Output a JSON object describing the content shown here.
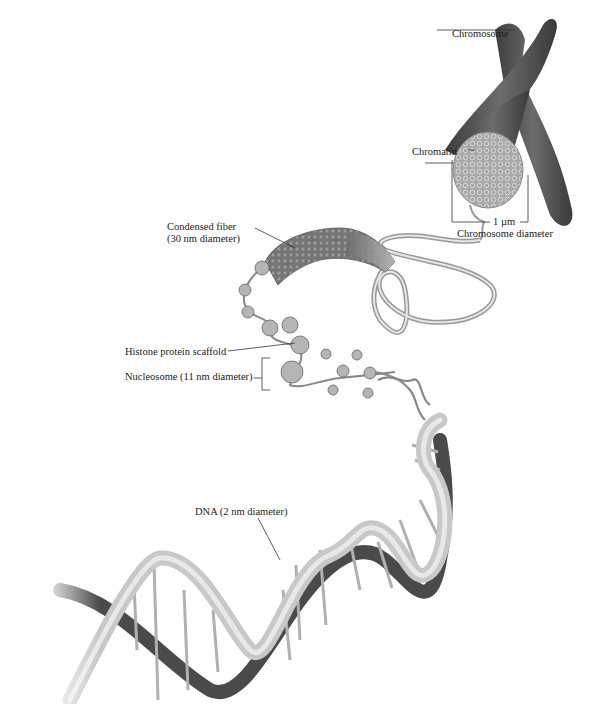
{
  "figure": {
    "labels": {
      "chromosome": "Chromosome",
      "chromatin": "Chromatin",
      "scale": "1 µm",
      "chromosome_diameter": "Chromosome diameter",
      "condensed_fiber_line1": "Condensed fiber",
      "condensed_fiber_line2": "(30 nm diameter)",
      "histone": "Histone protein scaffold",
      "nucleosome": "Nucleosome (11 nm diameter)",
      "dna": "DNA (2 nm diameter)"
    },
    "colors": {
      "chromosome": "#5a5a5a",
      "chromatin": "#9a9a9a",
      "dna_light": "#c8c8c8",
      "dna_dark": "#4a4a4a",
      "leader": "#333333"
    }
  }
}
